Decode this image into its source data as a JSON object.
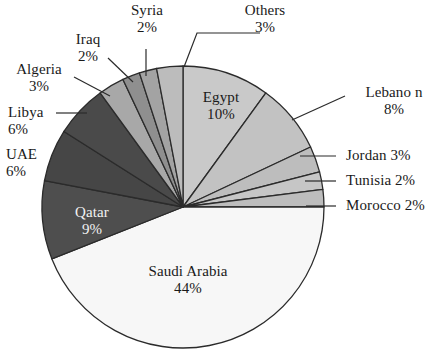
{
  "chart_data": {
    "type": "pie",
    "title": "",
    "subtitle": "",
    "xlabel": "",
    "ylabel": "",
    "legend_position": "none",
    "grid": false,
    "unit": "%",
    "total": 100,
    "categories": [
      "Egypt",
      "Lebanon",
      "Jordan",
      "Tunisia",
      "Morocco",
      "Saudi Arabia",
      "Qatar",
      "UAE",
      "Libya",
      "Algeria",
      "Iraq",
      "Syria",
      "Others"
    ],
    "values": [
      10,
      8,
      3,
      2,
      2,
      44,
      9,
      6,
      6,
      3,
      2,
      2,
      3
    ],
    "start_angle_deg": 0,
    "direction": "clockwise",
    "slices": [
      {
        "name": "Egypt",
        "label": "Egypt",
        "value": 10,
        "pct_text": "10%",
        "color": "#c9c9c9",
        "label_placement": "inside",
        "label_color": "dark"
      },
      {
        "name": "Lebanon",
        "label": "Lebano n",
        "value": 8,
        "pct_text": "8%",
        "color": "#c2c2c2",
        "label_placement": "outside",
        "label_color": "dark"
      },
      {
        "name": "Jordan",
        "label": "Jordan",
        "value": 3,
        "pct_text": "3%",
        "color": "#bdbdbd",
        "label_placement": "outside",
        "label_color": "dark"
      },
      {
        "name": "Tunisia",
        "label": "Tunisia",
        "value": 2,
        "pct_text": "2%",
        "color": "#c6c6c6",
        "label_placement": "outside",
        "label_color": "dark"
      },
      {
        "name": "Morocco",
        "label": "Morocco",
        "value": 2,
        "pct_text": "2%",
        "color": "#bdbdbd",
        "label_placement": "outside",
        "label_color": "dark"
      },
      {
        "name": "Saudi Arabia",
        "label": "Saudi Arabia",
        "value": 44,
        "pct_text": "44%",
        "color": "#f7f7f7",
        "label_placement": "inside",
        "label_color": "dark"
      },
      {
        "name": "Qatar",
        "label": "Qatar",
        "value": 9,
        "pct_text": "9%",
        "color": "#4e4e4e",
        "label_placement": "inside",
        "label_color": "light"
      },
      {
        "name": "UAE",
        "label": "UAE",
        "value": 6,
        "pct_text": "6%",
        "color": "#464646",
        "label_placement": "outside",
        "label_color": "dark"
      },
      {
        "name": "Libya",
        "label": "Libya",
        "value": 6,
        "pct_text": "6%",
        "color": "#4a4a4a",
        "label_placement": "outside",
        "label_color": "dark"
      },
      {
        "name": "Algeria",
        "label": "Algeria",
        "value": 3,
        "pct_text": "3%",
        "color": "#a8a8a8",
        "label_placement": "outside",
        "label_color": "dark"
      },
      {
        "name": "Iraq",
        "label": "Iraq",
        "value": 2,
        "pct_text": "2%",
        "color": "#8f8f8f",
        "label_placement": "outside",
        "label_color": "dark"
      },
      {
        "name": "Syria",
        "label": "Syria",
        "value": 2,
        "pct_text": "2%",
        "color": "#a3a3a3",
        "label_placement": "outside",
        "label_color": "dark"
      },
      {
        "name": "Others",
        "label": "Others",
        "value": 3,
        "pct_text": "3%",
        "color": "#bcbcbc",
        "label_placement": "outside",
        "label_color": "dark"
      }
    ]
  },
  "labels": {
    "syria": {
      "name": "Syria",
      "pct": "2%"
    },
    "others": {
      "name": "Others",
      "pct": "3%"
    },
    "iraq": {
      "name": "Iraq",
      "pct": "2%"
    },
    "algeria": {
      "name": "Algeria",
      "pct": "3%"
    },
    "libya": {
      "name": "Libya",
      "pct": "6%"
    },
    "uae": {
      "name": "UAE",
      "pct": "6%"
    },
    "egypt": {
      "name": "Egypt",
      "pct": "10%"
    },
    "lebanon": {
      "name": "Lebano n",
      "pct": "8%"
    },
    "jordan": {
      "name": "Jordan 3%",
      "pct": ""
    },
    "tunisia": {
      "name": "Tunisia 2%",
      "pct": ""
    },
    "morocco": {
      "name": "Morocco 2%",
      "pct": ""
    },
    "qatar": {
      "name": "Qatar",
      "pct": "9%"
    },
    "saudi_arabia": {
      "name": "Saudi Arabia",
      "pct": "44%"
    }
  },
  "style": {
    "stroke": "#2b2b2b",
    "background": "#ffffff",
    "leader_line_color": "#2b2b2b"
  }
}
